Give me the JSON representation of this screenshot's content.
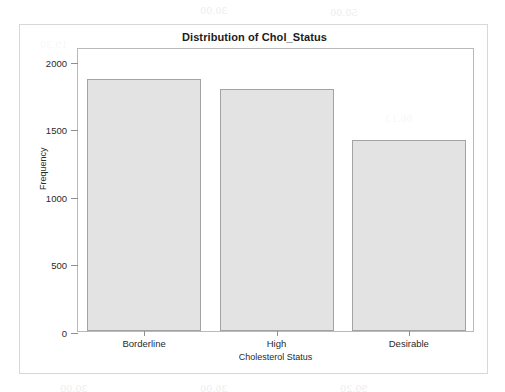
{
  "chart_data": {
    "type": "bar",
    "title": "Distribution of Chol_Status",
    "xlabel": "Cholesterol Status",
    "ylabel": "Frequency",
    "categories": [
      "Borderline",
      "High",
      "Desirable"
    ],
    "values": [
      1860,
      1786,
      1410
    ],
    "ylim": [
      0,
      2100
    ],
    "yticks": [
      0,
      500,
      1000,
      1500,
      2000
    ],
    "ytick_labels": [
      "0",
      "500",
      "1000",
      "1500",
      "2000"
    ],
    "grid": false,
    "legend": null,
    "bar_color": "#e3e3e3",
    "bar_edge_color": "#a3a3a3",
    "axis_color": "#b9b9b9",
    "text_color": "#1b1b1b"
  },
  "background_ghost_text": [
    "30.00",
    "50.00",
    "19.30",
    "02.01",
    "55.00",
    "36.00",
    "06.10",
    "06.13",
    "08.00",
    "90.20",
    "6.7400",
    "50.15",
    "00.36",
    "802.10",
    "00.36",
    "535.00",
    "10.39",
    "152.50",
    "31.0.0",
    "833.65"
  ]
}
